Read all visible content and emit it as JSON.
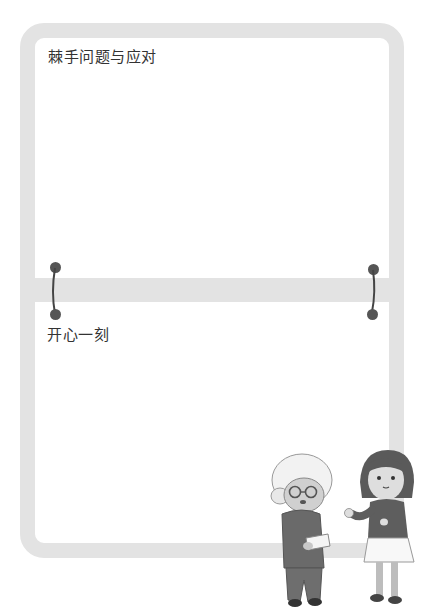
{
  "page": {
    "sections": [
      {
        "id": "tricky",
        "title": "棘手问题与应对"
      },
      {
        "id": "happy",
        "title": "开心一刻"
      }
    ],
    "colors": {
      "frame": "#e3e3e3",
      "text": "#333333",
      "pin": "#555555",
      "background": "#ffffff"
    },
    "illustration": {
      "description": "elderly grandmother holding a paper and a girl gesturing",
      "figures": [
        "grandmother",
        "girl"
      ]
    },
    "icons": [
      "pin-left",
      "pin-right"
    ]
  }
}
